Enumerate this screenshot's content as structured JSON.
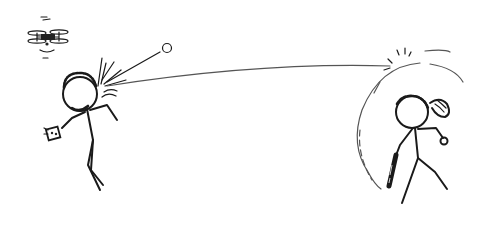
{
  "scene": {
    "description": "Hand-drawn stick-figure comic: a man with a drone overhead is hit in the head by a ball deflected off a force-field dome surrounding a woman with a ponytail holding a bat",
    "ink_color": "#1a1a1a",
    "background_color": "#ffffff",
    "elements": {
      "drone": "quadcopter-drone",
      "left_figure": "bearded man holding a remote controller",
      "ball_original": "ball",
      "trajectory": "ball trajectory line",
      "force_field": "force-field dome",
      "right_figure": "woman with ponytail holding a baseball bat and a ball"
    }
  }
}
